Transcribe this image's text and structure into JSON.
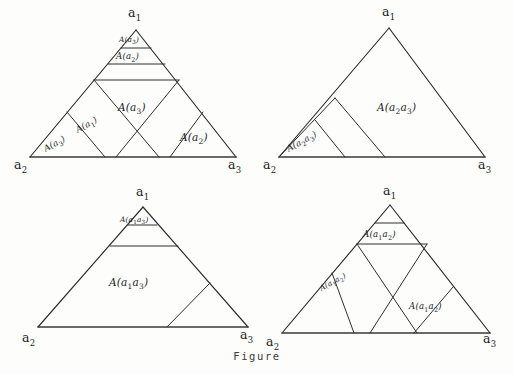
{
  "figure": {
    "caption": "Figure",
    "vertex_labels": {
      "a1": "a",
      "a2": "a",
      "a3": "a",
      "a1_sub": "1",
      "a2_sub": "2",
      "a3_sub": "3"
    },
    "ink_color": "#2b2b2b",
    "background_color": "#fdfdfc"
  },
  "panels": [
    {
      "id": "top-left",
      "position": "top-left",
      "vertices": [
        {
          "name": "apex",
          "label": "a",
          "sub": "1"
        },
        {
          "name": "bottom-left",
          "label": "a",
          "sub": "2"
        },
        {
          "name": "bottom-right",
          "label": "a",
          "sub": "3"
        }
      ],
      "regions": [
        {
          "name": "apex-strip-1",
          "label": "A(a",
          "sub": "3",
          "tail": ")"
        },
        {
          "name": "apex-strip-2",
          "label": "A(a",
          "sub": "2",
          "tail": ")"
        },
        {
          "name": "center-region",
          "label": "A(a",
          "sub": "3",
          "tail": ")"
        },
        {
          "name": "left-diagonal-band",
          "label": "A(a",
          "sub": "1",
          "tail": ")"
        },
        {
          "name": "left-corner",
          "label": "A(a",
          "sub": "3",
          "tail": ")"
        },
        {
          "name": "right-corner",
          "label": "A(a",
          "sub": "2",
          "tail": ")"
        }
      ]
    },
    {
      "id": "top-right",
      "position": "top-right",
      "vertices": [
        {
          "name": "apex",
          "label": "a",
          "sub": "1"
        },
        {
          "name": "bottom-left",
          "label": "a",
          "sub": "2"
        },
        {
          "name": "bottom-right",
          "label": "a",
          "sub": "3"
        }
      ],
      "regions": [
        {
          "name": "main-region",
          "label": "A(a",
          "sub": "2",
          "mid": "a",
          "sub2": "3",
          "tail": ")"
        },
        {
          "name": "left-corner",
          "label": "A(a",
          "sub": "2",
          "mid": "a",
          "sub2": "3",
          "tail": ")"
        }
      ]
    },
    {
      "id": "bottom-left",
      "position": "bottom-left",
      "vertices": [
        {
          "name": "apex",
          "label": "a",
          "sub": "1"
        },
        {
          "name": "bottom-left",
          "label": "a",
          "sub": "2"
        },
        {
          "name": "bottom-right",
          "label": "a",
          "sub": "3"
        }
      ],
      "regions": [
        {
          "name": "apex-strip",
          "label": "A(a",
          "sub": "1",
          "mid": "a",
          "sub2": "3",
          "tail": ")"
        },
        {
          "name": "main-region",
          "label": "A(a",
          "sub": "1",
          "mid": "a",
          "sub2": "3",
          "tail": ")"
        }
      ]
    },
    {
      "id": "bottom-right",
      "position": "bottom-right",
      "vertices": [
        {
          "name": "apex",
          "label": "a",
          "sub": "1"
        },
        {
          "name": "bottom-left",
          "label": "a",
          "sub": "2"
        },
        {
          "name": "bottom-right",
          "label": "a",
          "sub": "3"
        }
      ],
      "regions": [
        {
          "name": "apex-strip",
          "label": "A(a",
          "sub": "1",
          "mid": "a",
          "sub2": "2",
          "tail": ")"
        },
        {
          "name": "left-diagonal-band",
          "label": "A(a",
          "sub": "1",
          "mid": "a",
          "sub2": "2",
          "tail": ")"
        },
        {
          "name": "right-corner",
          "label": "A(a",
          "sub": "1",
          "mid": "a",
          "sub2": "2",
          "tail": ")"
        }
      ]
    }
  ]
}
